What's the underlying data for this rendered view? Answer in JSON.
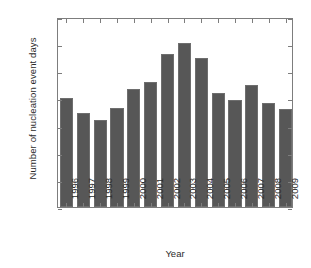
{
  "chart_data": {
    "type": "bar",
    "title": "",
    "xlabel": "Year",
    "ylabel": "Number of nucleation event days",
    "categories": [
      "1996",
      "1997",
      "1998",
      "1999",
      "2000",
      "2001",
      "2002",
      "2003",
      "2004",
      "2005",
      "2006",
      "2007",
      "2008",
      "2009"
    ],
    "values": [
      80,
      69,
      64,
      73,
      87,
      92,
      113,
      121,
      110,
      84,
      79,
      90,
      77,
      72
    ],
    "ylim": [
      0,
      140
    ],
    "yticks": [
      0,
      20,
      40,
      60,
      80,
      100,
      120,
      140
    ],
    "ytick_labels": [
      "0",
      "20",
      "40",
      "60",
      "80",
      "100",
      "120",
      "140"
    ],
    "grid": false,
    "legend": null,
    "bar_color": "#575757",
    "axis_color": "#7d7d7d",
    "text_color": "#2b2b2b",
    "background": "#ffffff"
  }
}
